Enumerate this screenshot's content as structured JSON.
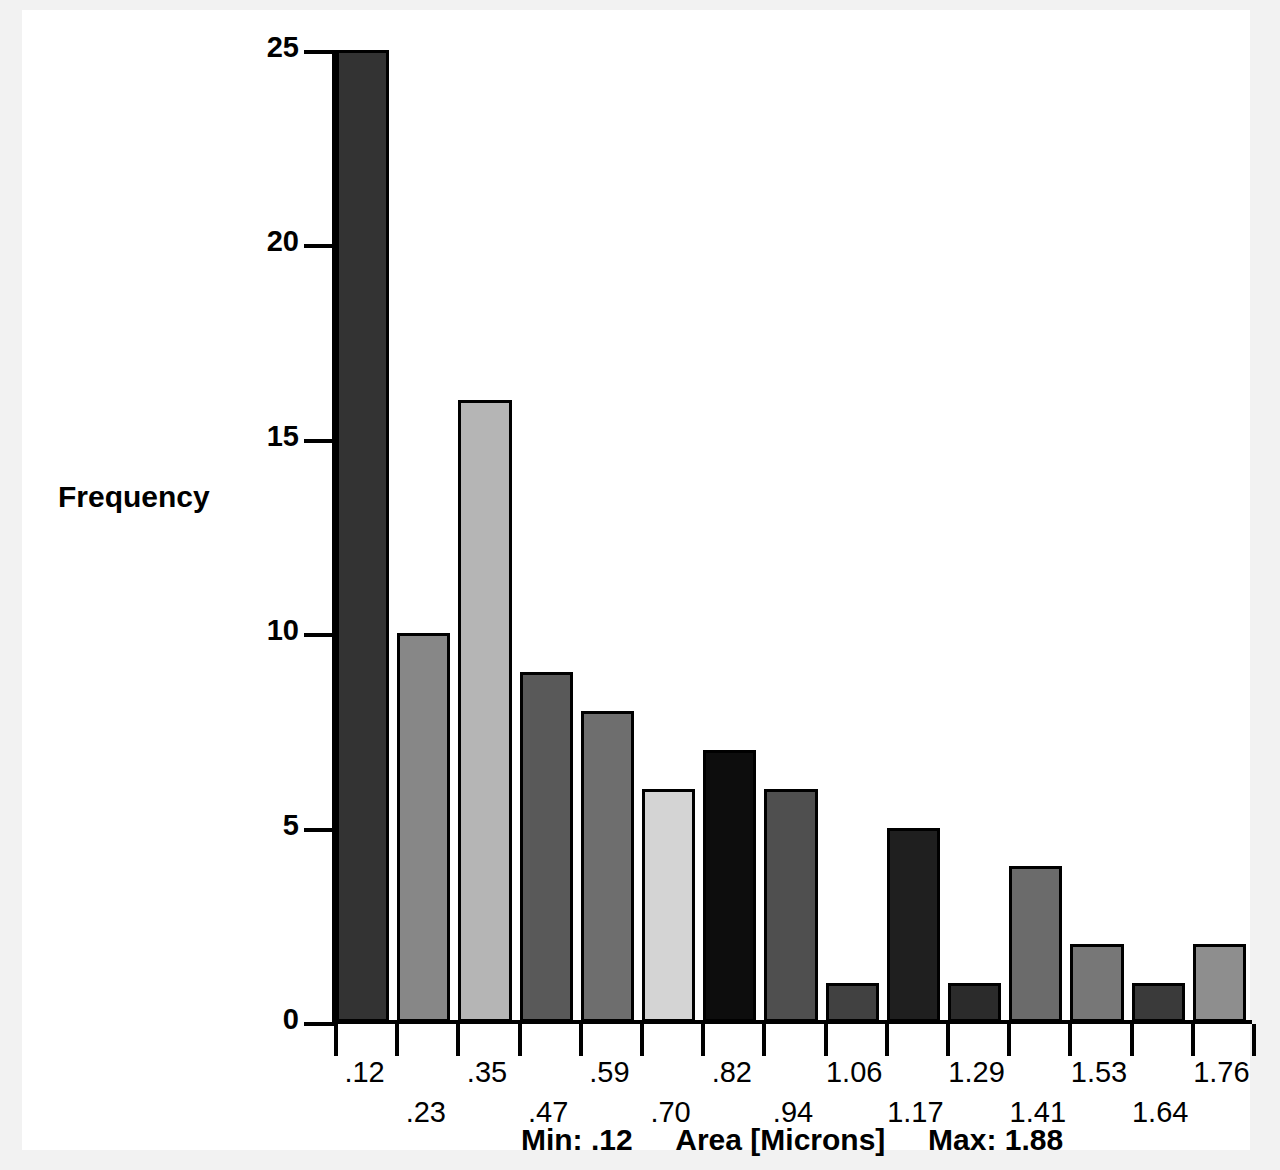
{
  "chart_data": {
    "type": "bar",
    "title": "",
    "subtitle": "",
    "xlabel": "Area [Microns]",
    "ylabel": "Frequency",
    "categories": [
      ".12",
      ".23",
      ".35",
      ".47",
      ".59",
      ".70",
      ".82",
      ".94",
      "1.06",
      "1.17",
      "1.29",
      "1.41",
      "1.53",
      "1.64",
      "1.76"
    ],
    "values": [
      25,
      10,
      16,
      9,
      8,
      6,
      7,
      6,
      1,
      5,
      1,
      4,
      2,
      1,
      2
    ],
    "bar_colors": [
      "#333333",
      "#878787",
      "#b5b5b5",
      "#595959",
      "#6e6e6e",
      "#d4d4d4",
      "#0d0d0d",
      "#4f4f4f",
      "#414141",
      "#1f1f1f",
      "#2b2b2b",
      "#6b6b6b",
      "#777777",
      "#3a3a3a",
      "#8e8e8e"
    ],
    "ylim": [
      0,
      25
    ],
    "yticks": [
      0,
      5,
      10,
      15,
      20,
      25
    ],
    "ytick_labels": [
      "0",
      "5",
      "10",
      "15",
      "20",
      "25"
    ],
    "grid": false,
    "legend": "none",
    "min_label": "Min: .12",
    "max_label": "Max: 1.88",
    "min_value": 0.12,
    "max_value": 1.88
  },
  "axes": {
    "y_title": "Frequency",
    "caption_min": "Min: .12",
    "caption_axis": "Area [Microns]",
    "caption_max": "Max: 1.88"
  }
}
